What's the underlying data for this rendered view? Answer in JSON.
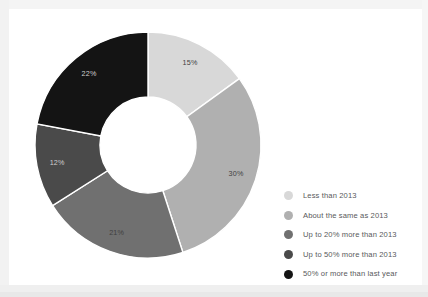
{
  "chart_data": {
    "type": "pie",
    "variant": "donut",
    "title": "",
    "xlabel": "",
    "ylabel": "",
    "categories": [
      "Less than 2013",
      "About the same as 2013",
      "Up to 20% more than 2013",
      "Up to 50% more than 2013",
      "50% or more than last year"
    ],
    "values": [
      15,
      30,
      21,
      12,
      22
    ],
    "value_labels": [
      "15%",
      "30%",
      "21%",
      "12%",
      "22%"
    ],
    "colors": [
      "#d8d8d8",
      "#b0b0b0",
      "#707070",
      "#4a4a4a",
      "#141414"
    ],
    "start_angle_deg": 0,
    "direction": "clockwise",
    "units": "percent",
    "total": 100,
    "inner_radius_ratio": 0.425,
    "legend_position": "right",
    "grid": false
  },
  "legend": {
    "items": [
      {
        "label": "Less than 2013",
        "color": "#d8d8d8"
      },
      {
        "label": "About the same as 2013",
        "color": "#b0b0b0"
      },
      {
        "label": "Up to 20% more than 2013",
        "color": "#707070"
      },
      {
        "label": "Up to 50% more than 2013",
        "color": "#4a4a4a"
      },
      {
        "label": "50% or more than last year",
        "color": "#141414"
      }
    ]
  }
}
